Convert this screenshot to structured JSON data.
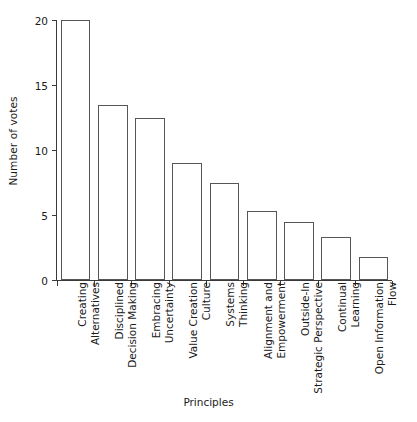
{
  "chart_data": {
    "type": "bar",
    "title": "",
    "xlabel": "Principles",
    "ylabel": "Number of votes",
    "categories": [
      "Creating Alternatives",
      "Disciplined Decision Making",
      "Embracing Uncertainty",
      "Value Creation Culture",
      "Systems Thinking",
      "Alignment and Empowerment",
      "Outside-In Strategic Perspective",
      "Continual Learning",
      "Open Information Flow"
    ],
    "values": [
      20,
      13.5,
      12.5,
      9,
      7.5,
      5.3,
      4.5,
      3.3,
      1.8
    ],
    "ylim": [
      0,
      20
    ],
    "yticks": [
      0,
      5,
      10,
      15,
      20
    ],
    "ytick_labels": [
      "0",
      "5",
      "10",
      "15",
      "20"
    ],
    "grid": false,
    "legend": false,
    "bar_fill_color": "#ffffff",
    "bar_edge_color": "#55565a",
    "axis_color": "#3a3a3a",
    "background_color": "#ffffff"
  },
  "axes": {
    "y_title": "Number of votes",
    "x_title": "Principles"
  },
  "x_tick_labels": [
    {
      "line1": "Creating",
      "line2": "Alternatives"
    },
    {
      "line1": "Disciplined",
      "line2": "Decision Making"
    },
    {
      "line1": "Embracing",
      "line2": "Uncertainty"
    },
    {
      "line1": "Value Creation",
      "line2": "Culture"
    },
    {
      "line1": "Systems",
      "line2": "Thinking"
    },
    {
      "line1": "Alignment and",
      "line2": "Empowerment"
    },
    {
      "line1": "Outside-In",
      "line2": "Strategic Perspective"
    },
    {
      "line1": "Continual",
      "line2": "Learning"
    },
    {
      "line1": "Open Information",
      "line2": "Flow"
    }
  ]
}
